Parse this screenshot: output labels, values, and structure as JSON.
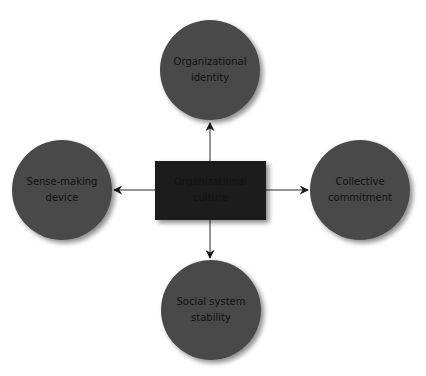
{
  "diagram": {
    "type": "hub-and-spoke",
    "colors": {
      "background": "#ffffff",
      "circle_fill": "#4a4a4a",
      "center_fill": "#1a1a1a",
      "arrow": "#2a2a2a",
      "shadow": "#bdbdbd"
    },
    "center": {
      "label_line1": "Organizational",
      "label_line2": "culture"
    },
    "nodes": [
      {
        "id": "top",
        "label_line1": "Organizational",
        "label_line2": "identity"
      },
      {
        "id": "left",
        "label_line1": "Sense-making",
        "label_line2": "device"
      },
      {
        "id": "right",
        "label_line1": "Collective",
        "label_line2": "commitment"
      },
      {
        "id": "bottom",
        "label_line1": "Social system",
        "label_line2": "stability"
      }
    ],
    "edges": [
      {
        "from": "center",
        "to": "top",
        "directed": true
      },
      {
        "from": "center",
        "to": "left",
        "directed": true
      },
      {
        "from": "center",
        "to": "right",
        "directed": true
      },
      {
        "from": "center",
        "to": "bottom",
        "directed": true
      }
    ]
  }
}
